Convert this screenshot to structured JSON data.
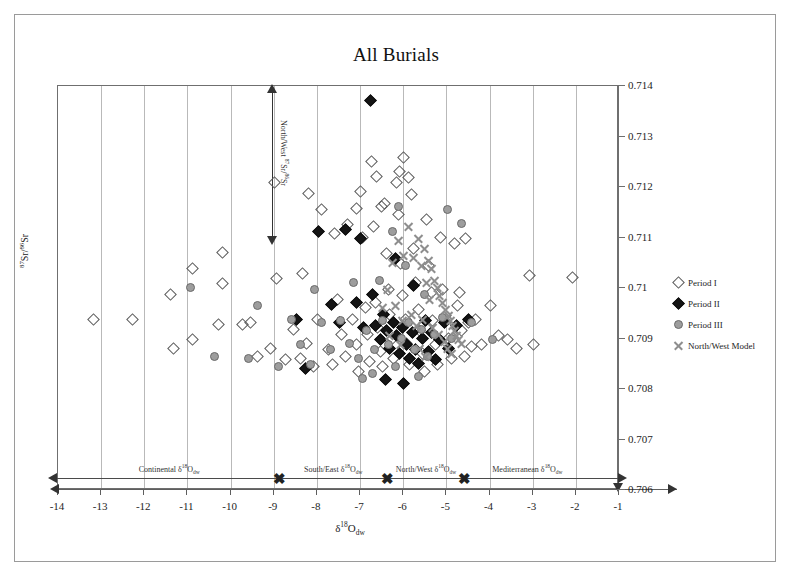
{
  "figure": {
    "title": "All Burials",
    "width": 792,
    "height": 578
  },
  "axes": {
    "x": {
      "label_html": "δ<sup>18</sup>O<sub>dw</sub>",
      "label_text": "δ18Odw",
      "min": -14,
      "max": -1,
      "ticks": [
        -14,
        -13,
        -12,
        -11,
        -10,
        -9,
        -8,
        -7,
        -6,
        -5,
        -4,
        -3,
        -2,
        -1
      ],
      "tick_labels": [
        "-14",
        "-13",
        "-12",
        "-11",
        "-10",
        "-9",
        "-8",
        "-7",
        "-6",
        "-5",
        "-4",
        "-3",
        "-2",
        "-1"
      ]
    },
    "y": {
      "label_html": "<sup>87</sup>Sr/<sup>86</sup>Sr",
      "label_text": "87Sr/86Sr",
      "min": 0.706,
      "max": 0.714,
      "ticks": [
        0.706,
        0.707,
        0.708,
        0.709,
        0.71,
        0.711,
        0.712,
        0.713,
        0.714
      ],
      "tick_labels": [
        "0.706",
        "0.707",
        "0.708",
        "0.709",
        "0.71",
        "0.711",
        "0.712",
        "0.713",
        "0.714"
      ],
      "position": "right"
    },
    "grid": "vertical-only"
  },
  "legend": {
    "position": "right",
    "items": [
      {
        "label": "Period I",
        "marker": "open-diamond",
        "class": "m-d1",
        "color": "#5a5a5a"
      },
      {
        "label": "Period II",
        "marker": "filled-diamond",
        "class": "m-d2",
        "color": "#141414"
      },
      {
        "label": "Period III",
        "marker": "gray-circle",
        "class": "m-c3",
        "color": "#9d9d9d"
      },
      {
        "label": "North/West Model",
        "marker": "x-cross",
        "class": "m-x4",
        "color": "#8e8e8e"
      }
    ]
  },
  "annotations": {
    "sr_range": {
      "label_html": "North/West <sup>87</sup>Sr/<sup>86</sup>Sr",
      "label_text": "North/West 87Sr/86Sr",
      "x_value": -8.95,
      "y_top": 0.7138,
      "y_bottom": 0.711,
      "style": "double-headed-vertical-arrow"
    },
    "regions": [
      {
        "label_html": "Continental δ<sup>18</sup>O<sub>dw</sub>",
        "label_text": "Continental δ18Odw",
        "x_from": -14.0,
        "x_to": -8.85,
        "center": -11.4
      },
      {
        "label_html": "South/East δ<sup>18</sup>O<sub>dw</sub>",
        "label_text": "South/East δ18Odw",
        "x_from": -8.85,
        "x_to": -6.35,
        "center": -7.6
      },
      {
        "label_html": "North/West δ<sup>18</sup>O<sub>dw</sub>",
        "label_text": "North/West δ18Odw",
        "x_from": -6.35,
        "x_to": -4.55,
        "center": -5.45
      },
      {
        "label_html": "Mediterranean δ<sup>18</sup>O<sub>dw</sub>",
        "label_text": "Mediterranean δ18Odw",
        "x_from": -4.55,
        "x_to": -1.0,
        "center": -3.1
      }
    ],
    "region_dividers": [
      -8.85,
      -6.35,
      -4.55
    ]
  },
  "chart_data": {
    "type": "scatter",
    "title": "All Burials",
    "xlabel": "δ18Odw",
    "ylabel": "87Sr/86Sr",
    "xlim": [
      -14,
      -1
    ],
    "ylim": [
      0.706,
      0.714
    ],
    "grid": "vertical",
    "legend_position": "right",
    "series": [
      {
        "name": "Period I",
        "marker": "open-diamond",
        "class": "m-d1",
        "points": [
          [
            -13.15,
            0.70935
          ],
          [
            -12.25,
            0.70935
          ],
          [
            -11.35,
            0.70985
          ],
          [
            -10.85,
            0.71035
          ],
          [
            -10.85,
            0.70895
          ],
          [
            -11.3,
            0.70878
          ],
          [
            -10.15,
            0.71068
          ],
          [
            -10.15,
            0.71005
          ],
          [
            -10.25,
            0.70925
          ],
          [
            -9.7,
            0.70925
          ],
          [
            -9.5,
            0.70928
          ],
          [
            -9.35,
            0.70862
          ],
          [
            -9.05,
            0.70878
          ],
          [
            -8.95,
            0.71205
          ],
          [
            -8.9,
            0.71015
          ],
          [
            -8.7,
            0.70855
          ],
          [
            -8.5,
            0.70915
          ],
          [
            -8.35,
            0.70858
          ],
          [
            -8.2,
            0.70888
          ],
          [
            -8.05,
            0.70842
          ],
          [
            -7.95,
            0.70935
          ],
          [
            -7.85,
            0.71152
          ],
          [
            -7.7,
            0.70875
          ],
          [
            -7.6,
            0.70845
          ],
          [
            -7.5,
            0.70975
          ],
          [
            -7.4,
            0.70905
          ],
          [
            -7.3,
            0.70862
          ],
          [
            -7.25,
            0.71122
          ],
          [
            -7.15,
            0.70935
          ],
          [
            -7.05,
            0.70885
          ],
          [
            -7.0,
            0.70832
          ],
          [
            -6.95,
            0.71188
          ],
          [
            -6.85,
            0.70958
          ],
          [
            -6.8,
            0.70905
          ],
          [
            -6.75,
            0.70852
          ],
          [
            -6.7,
            0.71248
          ],
          [
            -6.65,
            0.71118
          ],
          [
            -6.6,
            0.70968
          ],
          [
            -6.55,
            0.70918
          ],
          [
            -6.5,
            0.70872
          ],
          [
            -6.45,
            0.70842
          ],
          [
            -6.4,
            0.71165
          ],
          [
            -6.35,
            0.71065
          ],
          [
            -6.3,
            0.70995
          ],
          [
            -6.28,
            0.70945
          ],
          [
            -6.22,
            0.70898
          ],
          [
            -6.18,
            0.70858
          ],
          [
            -6.12,
            0.71205
          ],
          [
            -6.08,
            0.71142
          ],
          [
            -6.02,
            0.71045
          ],
          [
            -5.98,
            0.70982
          ],
          [
            -5.92,
            0.70935
          ],
          [
            -5.88,
            0.70888
          ],
          [
            -5.82,
            0.70845
          ],
          [
            -5.78,
            0.71182
          ],
          [
            -5.72,
            0.71075
          ],
          [
            -5.68,
            0.71008
          ],
          [
            -5.62,
            0.70955
          ],
          [
            -5.58,
            0.70912
          ],
          [
            -5.52,
            0.70868
          ],
          [
            -5.48,
            0.70832
          ],
          [
            -5.42,
            0.71132
          ],
          [
            -5.38,
            0.71042
          ],
          [
            -5.32,
            0.70988
          ],
          [
            -5.28,
            0.70932
          ],
          [
            -5.22,
            0.70885
          ],
          [
            -5.18,
            0.70845
          ],
          [
            -5.1,
            0.71098
          ],
          [
            -5.05,
            0.70995
          ],
          [
            -4.98,
            0.70942
          ],
          [
            -4.92,
            0.70898
          ],
          [
            -4.85,
            0.70858
          ],
          [
            -4.78,
            0.71085
          ],
          [
            -4.7,
            0.70962
          ],
          [
            -4.62,
            0.70912
          ],
          [
            -4.55,
            0.70862
          ],
          [
            -4.45,
            0.70928
          ],
          [
            -4.38,
            0.70882
          ],
          [
            -4.28,
            0.70935
          ],
          [
            -4.15,
            0.70885
          ],
          [
            -3.95,
            0.70962
          ],
          [
            -3.75,
            0.70902
          ],
          [
            -3.55,
            0.70895
          ],
          [
            -3.35,
            0.70878
          ],
          [
            -3.05,
            0.71022
          ],
          [
            -2.95,
            0.70885
          ],
          [
            -2.05,
            0.71018
          ],
          [
            -8.3,
            0.71025
          ],
          [
            -8.15,
            0.71185
          ],
          [
            -7.55,
            0.71105
          ],
          [
            -6.9,
            0.71098
          ],
          [
            -5.95,
            0.71255
          ],
          [
            -6.05,
            0.71228
          ],
          [
            -5.85,
            0.71215
          ],
          [
            -6.58,
            0.71218
          ],
          [
            -6.48,
            0.71158
          ],
          [
            -7.05,
            0.71155
          ],
          [
            -4.65,
            0.70988
          ],
          [
            -4.52,
            0.71095
          ]
        ]
      },
      {
        "name": "Period II",
        "marker": "filled-diamond",
        "class": "m-d2",
        "points": [
          [
            -6.72,
            0.71368
          ],
          [
            -8.22,
            0.70838
          ],
          [
            -7.92,
            0.71108
          ],
          [
            -7.3,
            0.71112
          ],
          [
            -7.05,
            0.70968
          ],
          [
            -6.88,
            0.70918
          ],
          [
            -6.6,
            0.70922
          ],
          [
            -6.5,
            0.70895
          ],
          [
            -6.42,
            0.70945
          ],
          [
            -6.35,
            0.70912
          ],
          [
            -6.28,
            0.70878
          ],
          [
            -6.2,
            0.70928
          ],
          [
            -6.12,
            0.70902
          ],
          [
            -6.05,
            0.70868
          ],
          [
            -5.98,
            0.70918
          ],
          [
            -5.9,
            0.70885
          ],
          [
            -5.82,
            0.70858
          ],
          [
            -5.75,
            0.70908
          ],
          [
            -5.68,
            0.70875
          ],
          [
            -5.6,
            0.70848
          ],
          [
            -5.52,
            0.70898
          ],
          [
            -5.45,
            0.70932
          ],
          [
            -5.38,
            0.70872
          ],
          [
            -5.3,
            0.70908
          ],
          [
            -5.22,
            0.70855
          ],
          [
            -5.12,
            0.70895
          ],
          [
            -5.02,
            0.70928
          ],
          [
            -4.92,
            0.70878
          ],
          [
            -4.72,
            0.70922
          ],
          [
            -4.45,
            0.70935
          ],
          [
            -7.62,
            0.70965
          ],
          [
            -7.45,
            0.70928
          ],
          [
            -6.95,
            0.71095
          ],
          [
            -6.15,
            0.71055
          ],
          [
            -5.72,
            0.71002
          ],
          [
            -8.45,
            0.70935
          ],
          [
            -6.68,
            0.70985
          ],
          [
            -5.95,
            0.70808
          ],
          [
            -6.38,
            0.70815
          ]
        ]
      },
      {
        "name": "Period III",
        "marker": "gray-circle",
        "class": "m-c3",
        "points": [
          [
            -10.9,
            0.70998
          ],
          [
            -10.35,
            0.70862
          ],
          [
            -9.55,
            0.70858
          ],
          [
            -9.35,
            0.70962
          ],
          [
            -8.85,
            0.70842
          ],
          [
            -8.55,
            0.70935
          ],
          [
            -8.35,
            0.70885
          ],
          [
            -8.12,
            0.70845
          ],
          [
            -7.85,
            0.70928
          ],
          [
            -7.65,
            0.70875
          ],
          [
            -7.42,
            0.70932
          ],
          [
            -7.22,
            0.70888
          ],
          [
            -7.0,
            0.70858
          ],
          [
            -6.82,
            0.70912
          ],
          [
            -6.62,
            0.70875
          ],
          [
            -6.45,
            0.70932
          ],
          [
            -6.3,
            0.70885
          ],
          [
            -6.15,
            0.70842
          ],
          [
            -6.0,
            0.70898
          ],
          [
            -5.85,
            0.70928
          ],
          [
            -5.7,
            0.70875
          ],
          [
            -5.55,
            0.70915
          ],
          [
            -5.4,
            0.70862
          ],
          [
            -5.25,
            0.70905
          ],
          [
            -5.05,
            0.70938
          ],
          [
            -4.85,
            0.70898
          ],
          [
            -4.62,
            0.71125
          ],
          [
            -4.38,
            0.70928
          ],
          [
            -6.52,
            0.71012
          ],
          [
            -6.22,
            0.71108
          ],
          [
            -5.92,
            0.71042
          ],
          [
            -7.12,
            0.71008
          ],
          [
            -6.08,
            0.71158
          ],
          [
            -5.48,
            0.70985
          ],
          [
            -4.95,
            0.71152
          ],
          [
            -8.02,
            0.70995
          ],
          [
            -6.68,
            0.70828
          ],
          [
            -6.92,
            0.70818
          ],
          [
            -5.62,
            0.70822
          ],
          [
            -3.9,
            0.70895
          ]
        ]
      },
      {
        "name": "North/West Model",
        "marker": "x-cross",
        "class": "m-x4",
        "points": [
          [
            -5.85,
            0.71118
          ],
          [
            -5.62,
            0.71095
          ],
          [
            -5.48,
            0.71075
          ],
          [
            -5.38,
            0.71052
          ],
          [
            -5.3,
            0.71035
          ],
          [
            -5.25,
            0.71012
          ],
          [
            -5.18,
            0.70998
          ],
          [
            -5.12,
            0.70982
          ],
          [
            -5.05,
            0.70968
          ],
          [
            -4.98,
            0.70955
          ],
          [
            -4.92,
            0.70942
          ],
          [
            -4.88,
            0.70932
          ],
          [
            -4.82,
            0.70922
          ],
          [
            -4.78,
            0.70912
          ],
          [
            -4.72,
            0.70902
          ],
          [
            -4.68,
            0.70895
          ],
          [
            -4.62,
            0.70888
          ],
          [
            -5.55,
            0.71042
          ],
          [
            -5.42,
            0.71008
          ],
          [
            -5.35,
            0.70975
          ],
          [
            -5.72,
            0.71058
          ],
          [
            -5.95,
            0.71062
          ],
          [
            -6.08,
            0.71092
          ],
          [
            -6.22,
            0.71048
          ],
          [
            -6.32,
            0.70995
          ],
          [
            -6.45,
            0.70958
          ],
          [
            -6.15,
            0.70962
          ],
          [
            -5.98,
            0.70932
          ],
          [
            -5.78,
            0.70945
          ],
          [
            -5.65,
            0.70922
          ],
          [
            -5.52,
            0.70935
          ],
          [
            -5.28,
            0.70918
          ],
          [
            -5.15,
            0.70905
          ],
          [
            -5.02,
            0.70892
          ],
          [
            -4.95,
            0.70878
          ],
          [
            -4.85,
            0.70868
          ],
          [
            -5.45,
            0.70862
          ],
          [
            -5.58,
            0.70878
          ],
          [
            -6.02,
            0.70885
          ],
          [
            -6.28,
            0.70902
          ]
        ]
      }
    ]
  }
}
